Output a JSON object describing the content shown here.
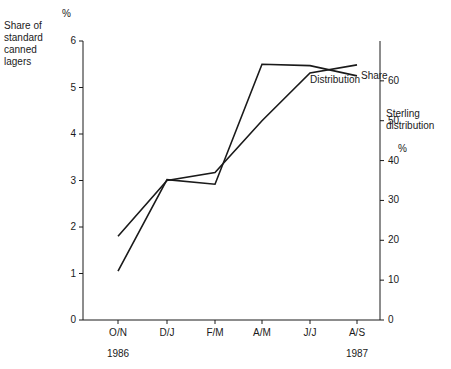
{
  "chart_data": {
    "type": "line",
    "title": "",
    "categories": [
      "O/N",
      "D/J",
      "F/M",
      "A/M",
      "J/J",
      "A/S"
    ],
    "series": [
      {
        "name": "Share",
        "axis": "left",
        "label": "Share",
        "values": [
          1.05,
          3.02,
          2.92,
          5.5,
          5.47,
          5.25
        ]
      },
      {
        "name": "Distribution",
        "axis": "right",
        "label": "Distribution",
        "values": [
          21,
          35,
          37,
          50,
          62,
          64
        ]
      }
    ],
    "left_axis": {
      "title": "Share of standard canned lagers",
      "unit": "%",
      "ticks": [
        "0",
        "1",
        "2",
        "3",
        "4",
        "5",
        "6"
      ],
      "ylim": [
        0,
        6
      ],
      "grid": false
    },
    "right_axis": {
      "title": "Sterling distribution",
      "unit": "%",
      "ticks": [
        "0",
        "10",
        "20",
        "30",
        "40",
        "50",
        "60"
      ],
      "ylim": [
        0,
        70
      ],
      "grid": false
    },
    "xaxis": {
      "label": "",
      "tick_labels": [
        "O/N",
        "D/J",
        "F/M",
        "A/M",
        "J/J",
        "A/S"
      ],
      "period_labels": [
        {
          "text": "1986",
          "at": "O/N"
        },
        {
          "text": "1987",
          "at": "A/S"
        }
      ]
    },
    "legend_position": "inline-right",
    "annotations": [
      {
        "text": "Share",
        "series": "Share"
      },
      {
        "text": "Distribution",
        "series": "Distribution"
      }
    ]
  }
}
